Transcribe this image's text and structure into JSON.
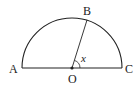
{
  "diagram": {
    "type": "semicircle",
    "stroke_color": "#222222",
    "points": {
      "A": {
        "label": "A"
      },
      "B": {
        "label": "B"
      },
      "C": {
        "label": "C"
      },
      "O": {
        "label": "O"
      }
    },
    "angle": {
      "label": "x",
      "between": [
        "OB",
        "OC"
      ]
    }
  }
}
